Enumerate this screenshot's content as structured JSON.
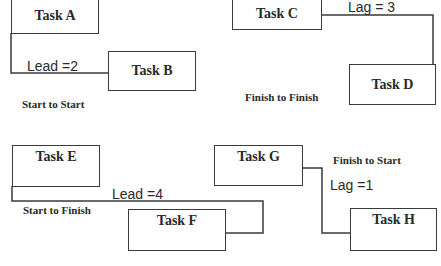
{
  "diagram": {
    "tasks": {
      "a": "Task A",
      "b": "Task B",
      "c": "Task C",
      "d": "Task D",
      "e": "Task E",
      "f": "Task F",
      "g": "Task G",
      "h": "Task H"
    },
    "relationships": [
      {
        "type": "Start to Start",
        "from": "Task A",
        "to": "Task B",
        "modifier": "Lead =2"
      },
      {
        "type": "Finish to Finish",
        "from": "Task C",
        "to": "Task D",
        "modifier": "Lag = 3"
      },
      {
        "type": "Start to Finish",
        "from": "Task E",
        "to": "Task F",
        "modifier": "Lead =4"
      },
      {
        "type": "Finish to Start",
        "from": "Task G",
        "to": "Task H",
        "modifier": "Lag =1"
      }
    ],
    "line_color": "#3a3a3a"
  }
}
